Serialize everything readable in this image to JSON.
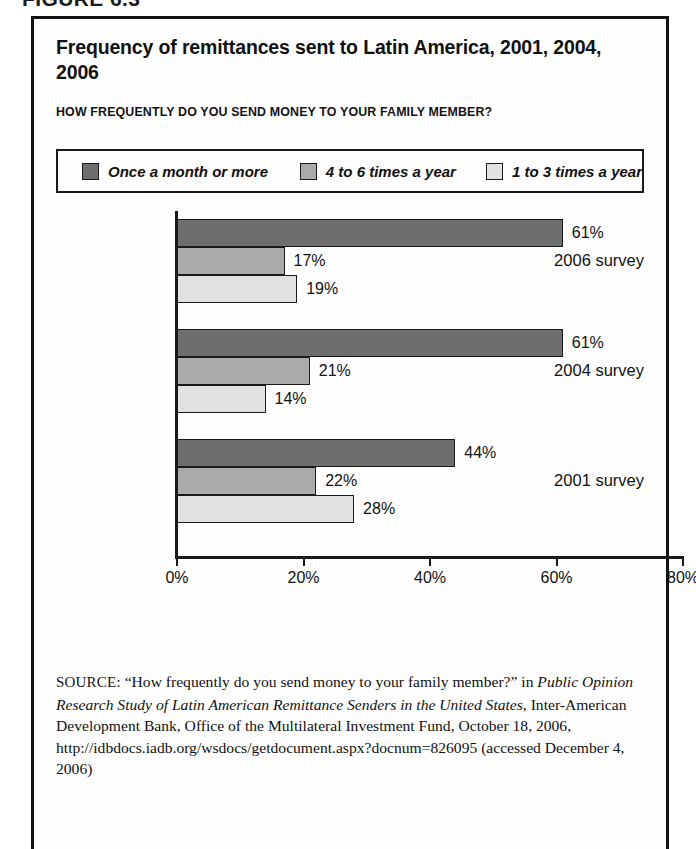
{
  "figure_number": "FIGURE 6.3",
  "chart_title": "Frequency of remittances sent to Latin America, 2001, 2004, 2006",
  "chart_subtitle": "HOW FREQUENTLY DO YOU SEND MONEY TO YOUR FAMILY MEMBER?",
  "legend": {
    "items": [
      {
        "label": "Once a month or more",
        "color": "#6e6e6e"
      },
      {
        "label": "4 to 6 times a year",
        "color": "#aaaaaa"
      },
      {
        "label": "1 to 3 times a year",
        "color": "#e2e2e2"
      }
    ]
  },
  "axis": {
    "ticks": [
      "0%",
      "20%",
      "40%",
      "60%",
      "80%"
    ]
  },
  "groups": [
    {
      "label": "2006 survey",
      "bars": [
        {
          "value": 61,
          "value_label": "61%",
          "series": "Once a month or more"
        },
        {
          "value": 17,
          "value_label": "17%",
          "series": "4 to 6 times a year"
        },
        {
          "value": 19,
          "value_label": "19%",
          "series": "1 to 3 times a year"
        }
      ]
    },
    {
      "label": "2004 survey",
      "bars": [
        {
          "value": 61,
          "value_label": "61%",
          "series": "Once a month or more"
        },
        {
          "value": 21,
          "value_label": "21%",
          "series": "4 to 6 times a year"
        },
        {
          "value": 14,
          "value_label": "14%",
          "series": "1 to 3 times a year"
        }
      ]
    },
    {
      "label": "2001 survey",
      "bars": [
        {
          "value": 44,
          "value_label": "44%",
          "series": "Once a month or more"
        },
        {
          "value": 22,
          "value_label": "22%",
          "series": "4 to 6 times a year"
        },
        {
          "value": 28,
          "value_label": "28%",
          "series": "1 to 3 times a year"
        }
      ]
    }
  ],
  "source": {
    "label": "SOURCE:",
    "line1_quote": " “How frequently do you send money to your family member?”",
    "line2_prefix": "in ",
    "title_italic": "Public Opinion Research Study of Latin American Remittance Senders in the United States",
    "rest": ", Inter-American Development Bank, Office of the Multilateral Investment Fund, October 18, 2006, http://idbdocs.iadb.org/wsdocs/getdocument.aspx?docnum=826095 (accessed December 4, 2006)"
  },
  "chart_data": {
    "type": "bar",
    "orientation": "horizontal",
    "title": "Frequency of remittances sent to Latin America, 2001, 2004, 2006",
    "subtitle": "HOW FREQUENTLY DO YOU SEND MONEY TO YOUR FAMILY MEMBER?",
    "categories": [
      "2006 survey",
      "2004 survey",
      "2001 survey"
    ],
    "series": [
      {
        "name": "Once a month or more",
        "values": [
          61,
          61,
          44
        ],
        "color": "#6e6e6e"
      },
      {
        "name": "4 to 6 times a year",
        "values": [
          17,
          21,
          22
        ],
        "color": "#aaaaaa"
      },
      {
        "name": "1 to 3 times a year",
        "values": [
          19,
          14,
          28
        ],
        "color": "#e2e2e2"
      }
    ],
    "xlabel": "",
    "ylabel": "",
    "xlim": [
      0,
      80
    ],
    "xticks": [
      0,
      20,
      40,
      60,
      80
    ],
    "xtick_labels": [
      "0%",
      "20%",
      "40%",
      "60%",
      "80%"
    ],
    "grid": false,
    "legend_position": "top",
    "value_labels": true,
    "units": "percent"
  }
}
